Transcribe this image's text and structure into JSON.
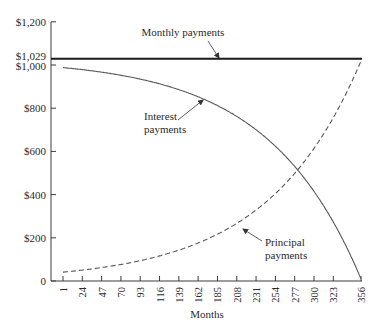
{
  "chart_data": {
    "type": "line",
    "title": "",
    "xlabel": "Months",
    "ylabel": "",
    "ylim": [
      0,
      1200
    ],
    "xlim": [
      1,
      356
    ],
    "grid": false,
    "legend": "none (inline annotations)",
    "y_ticks": [
      {
        "value": 0,
        "label": "0"
      },
      {
        "value": 200,
        "label": "$200"
      },
      {
        "value": 400,
        "label": "$400"
      },
      {
        "value": 600,
        "label": "$600"
      },
      {
        "value": 800,
        "label": "$800"
      },
      {
        "value": 1000,
        "label": "$1,000"
      },
      {
        "value": 1029,
        "label": "$1,029"
      },
      {
        "value": 1200,
        "label": "$1,200"
      }
    ],
    "x_ticks": [
      1,
      24,
      47,
      70,
      93,
      116,
      139,
      162,
      185,
      208,
      231,
      254,
      277,
      300,
      323,
      356
    ],
    "x": [
      1,
      24,
      47,
      70,
      93,
      116,
      139,
      162,
      185,
      208,
      231,
      254,
      277,
      300,
      323,
      356
    ],
    "series": [
      {
        "name": "Monthly payments",
        "style": "solid-thick",
        "values": [
          1029,
          1029,
          1029,
          1029,
          1029,
          1029,
          1029,
          1029,
          1029,
          1029,
          1029,
          1029,
          1029,
          1029,
          1029,
          1029
        ]
      },
      {
        "name": "Interest payments",
        "style": "solid",
        "values": [
          988,
          980,
          971,
          960,
          948,
          934,
          918,
          900,
          880,
          857,
          830,
          800,
          766,
          727,
          683,
          10
        ]
      },
      {
        "name": "Principal payments",
        "style": "dashed",
        "values": [
          41,
          49,
          58,
          69,
          81,
          95,
          111,
          129,
          149,
          172,
          199,
          229,
          263,
          302,
          346,
          1019
        ]
      }
    ],
    "annotations": [
      {
        "text": "Monthly payments",
        "points_to": "Monthly payments"
      },
      {
        "text_lines": [
          "Interest",
          "payments"
        ],
        "points_to": "Interest payments"
      },
      {
        "text_lines": [
          "Principal",
          "payments"
        ],
        "points_to": "Principal payments"
      }
    ]
  },
  "labels": {
    "xlabel": "Months",
    "anno_monthly": "Monthly payments",
    "anno_interest_1": "Interest",
    "anno_interest_2": "payments",
    "anno_principal_1": "Principal",
    "anno_principal_2": "payments"
  },
  "colors": {
    "axis": "#3a3a3a",
    "monthly": "#1a1a1a",
    "interest": "#555555",
    "principal": "#555555"
  }
}
